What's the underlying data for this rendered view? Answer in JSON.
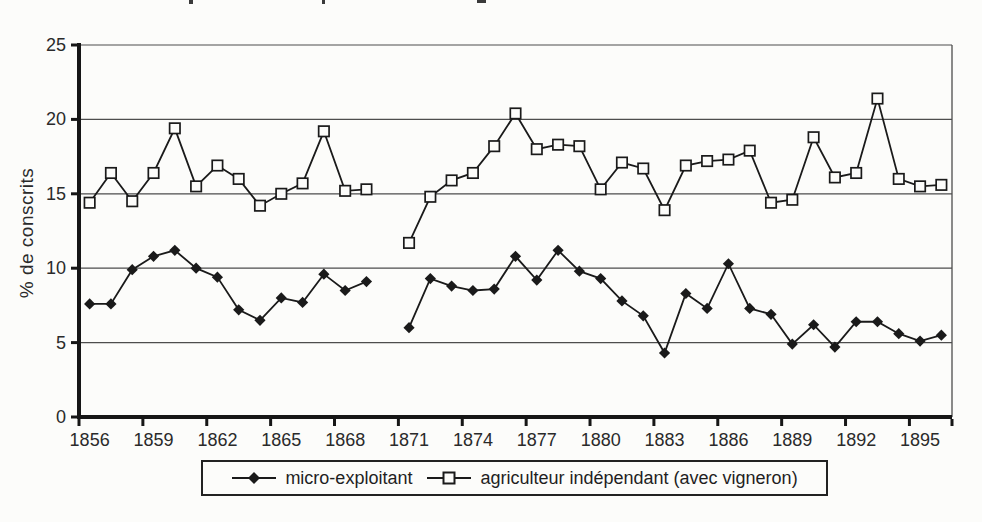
{
  "chart_data": {
    "type": "line",
    "title": "",
    "xlabel": "",
    "ylabel": "% de conscrits",
    "ylim": [
      0,
      25
    ],
    "yticks": [
      0,
      5,
      10,
      15,
      20,
      25
    ],
    "grid": "horizontal",
    "legend_position": "bottom",
    "x": [
      1856,
      1857,
      1858,
      1859,
      1860,
      1861,
      1862,
      1863,
      1864,
      1865,
      1866,
      1867,
      1868,
      1869,
      1870,
      1871,
      1872,
      1873,
      1874,
      1875,
      1876,
      1877,
      1878,
      1879,
      1880,
      1881,
      1882,
      1883,
      1884,
      1885,
      1886,
      1887,
      1888,
      1889,
      1890,
      1891,
      1892,
      1893,
      1894,
      1895,
      1896
    ],
    "xtick_labels": [
      "1856",
      "1859",
      "1862",
      "1865",
      "1868",
      "1871",
      "1874",
      "1877",
      "1880",
      "1883",
      "1886",
      "1889",
      "1892",
      "1895"
    ],
    "series": [
      {
        "name": "micro-exploitant",
        "marker": "filled-diamond",
        "color": "#1a1a1a",
        "values": [
          7.6,
          7.6,
          9.9,
          10.8,
          11.2,
          10.0,
          9.4,
          7.2,
          6.5,
          8.0,
          7.7,
          9.6,
          8.5,
          9.1,
          null,
          6.0,
          9.3,
          8.8,
          8.5,
          8.6,
          10.8,
          9.2,
          11.2,
          9.8,
          9.3,
          7.8,
          6.8,
          4.3,
          8.3,
          7.3,
          10.3,
          7.3,
          6.9,
          4.9,
          6.2,
          4.7,
          6.4,
          6.4,
          5.6,
          5.1,
          5.5
        ]
      },
      {
        "name": "agriculteur indépendant (avec vigneron)",
        "marker": "open-square",
        "color": "#1a1a1a",
        "values": [
          14.4,
          16.4,
          14.5,
          16.4,
          19.4,
          15.5,
          16.9,
          16.0,
          14.2,
          15.0,
          15.7,
          19.2,
          15.2,
          15.3,
          null,
          11.7,
          14.8,
          15.9,
          16.4,
          18.2,
          20.4,
          18.0,
          18.3,
          18.2,
          15.3,
          17.1,
          16.7,
          13.9,
          16.9,
          17.2,
          17.3,
          17.9,
          14.4,
          14.6,
          18.8,
          16.1,
          16.4,
          21.4,
          16.0,
          15.5,
          15.6
        ]
      }
    ]
  }
}
